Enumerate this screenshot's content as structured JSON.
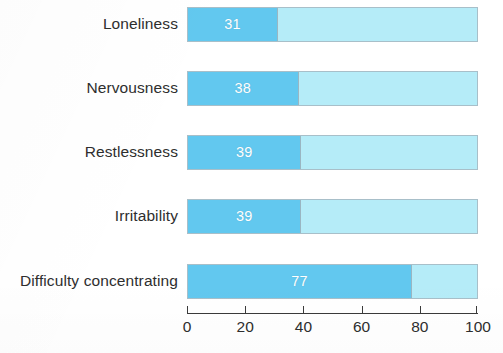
{
  "chart_data": {
    "type": "bar",
    "orientation": "horizontal",
    "title": "",
    "subtitle": "",
    "xlabel": "",
    "ylabel": "",
    "categories": [
      "Loneliness",
      "Nervousness",
      "Restlessness",
      "Irritability",
      "Difficulty concentrating"
    ],
    "values": [
      31,
      38,
      39,
      39,
      77
    ],
    "value_labels": [
      "31",
      "38",
      "39",
      "39",
      "77"
    ],
    "xlim": [
      0,
      100
    ],
    "tick_values": [
      0,
      20,
      40,
      60,
      80,
      100
    ],
    "tick_labels": [
      "0",
      "20",
      "40",
      "60",
      "80",
      "100"
    ],
    "grid": false,
    "legend": "none",
    "series": [
      {
        "name": "Percent reporting",
        "values": [
          31,
          38,
          39,
          39,
          77
        ]
      }
    ],
    "remainder_track_max": 100,
    "colors": {
      "fill": "#62c8ef",
      "track": "#b5ecf8",
      "value_text": "#ffffff",
      "axis": "#3a3a3a",
      "label_text": "#2e2e2e",
      "background": "#ffffff"
    }
  }
}
